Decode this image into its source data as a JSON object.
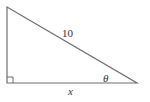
{
  "diagram": {
    "type": "right-triangle",
    "hypotenuse_label": "10",
    "angle_label": "θ",
    "base_label": "x",
    "right_angle_marker": true,
    "stroke_color": "#6e6e6e"
  }
}
